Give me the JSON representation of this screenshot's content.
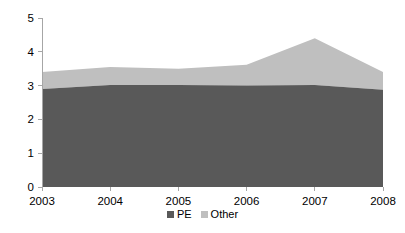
{
  "chart_data": {
    "type": "area",
    "stacked": true,
    "title": "",
    "subtitle": "",
    "xlabel": "",
    "ylabel": "",
    "categories": [
      "2003",
      "2004",
      "2005",
      "2006",
      "2007",
      "2008"
    ],
    "x": [
      2003,
      2004,
      2005,
      2006,
      2007,
      2008
    ],
    "series": [
      {
        "name": "PE",
        "color": "#595959",
        "values": [
          2.9,
          3.02,
          3.02,
          3.0,
          3.02,
          2.88
        ]
      },
      {
        "name": "Other",
        "color": "#bfbfbf",
        "values": [
          0.5,
          0.53,
          0.48,
          0.62,
          1.38,
          0.52
        ]
      }
    ],
    "stack_totals": [
      3.4,
      3.55,
      3.5,
      3.62,
      4.4,
      3.4
    ],
    "ylim": [
      0,
      5
    ],
    "xlim": [
      2003,
      2008
    ],
    "y_ticks": [
      "0",
      "1",
      "2",
      "3",
      "4",
      "5"
    ],
    "y_tick_values": [
      0,
      1,
      2,
      3,
      4,
      5
    ],
    "x_ticks": [
      "2003",
      "2004",
      "2005",
      "2006",
      "2007",
      "2008"
    ],
    "grid": false,
    "legend_position": "bottom",
    "legend": [
      {
        "label": "PE",
        "color": "#595959"
      },
      {
        "label": "Other",
        "color": "#bfbfbf"
      }
    ]
  },
  "axis": {
    "y_axis_name": "value-axis",
    "x_axis_name": "category-axis"
  },
  "colors": {
    "series_pe": "#595959",
    "series_other": "#bfbfbf",
    "axis": "#a6a6a6",
    "text": "#000000",
    "background": "#ffffff"
  }
}
